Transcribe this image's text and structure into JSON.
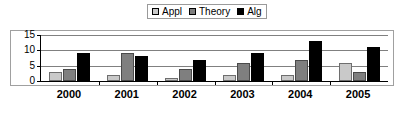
{
  "chart_data": {
    "type": "bar",
    "title": "",
    "xlabel": "",
    "ylabel": "",
    "categories": [
      "2000",
      "2001",
      "2002",
      "2003",
      "2004",
      "2005"
    ],
    "series": [
      {
        "name": "Appl",
        "color": "#c9c9c9",
        "values": [
          3,
          2,
          1,
          2,
          2,
          6
        ]
      },
      {
        "name": "Theory",
        "color": "#7f7f7f",
        "values": [
          4,
          9,
          4,
          6,
          7,
          3
        ]
      },
      {
        "name": "Alg",
        "color": "#000000",
        "values": [
          9,
          8,
          7,
          9,
          13,
          11
        ]
      }
    ],
    "ylim": [
      0,
      15
    ],
    "yticks": [
      0,
      5,
      10,
      15
    ],
    "ytick_labels": [
      "0",
      "5",
      "10",
      "15"
    ],
    "grid": true,
    "legend_position": "top-center"
  },
  "legend": {
    "entries": [
      {
        "label": "Appl"
      },
      {
        "label": "Theory"
      },
      {
        "label": "Alg"
      }
    ]
  },
  "axes": {
    "y_tick_labels": [
      "15",
      "10",
      "5",
      "0"
    ],
    "x_tick_labels": [
      "2000",
      "2001",
      "2002",
      "2003",
      "2004",
      "2005"
    ]
  }
}
